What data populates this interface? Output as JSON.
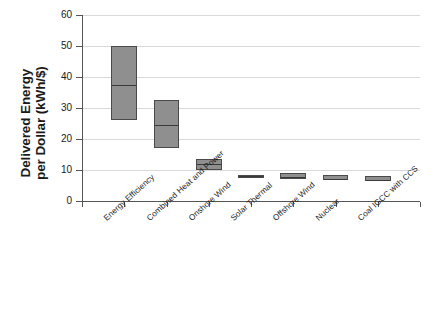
{
  "chart_data": {
    "type": "bar",
    "title": "",
    "xlabel": "",
    "ylabel_line1": "Delivered Energy",
    "ylabel_line2": "per Dollar (kWh/$)",
    "ylim": [
      0,
      60
    ],
    "yticks": [
      0,
      10,
      20,
      30,
      40,
      50,
      60
    ],
    "ytick_labels": [
      "0",
      "10",
      "20",
      "30",
      "40",
      "50",
      "60"
    ],
    "grid": true,
    "legend": "none",
    "box_fill_color": "#8f8f8f",
    "box_edge_color": "#4a4a4a",
    "categories": [
      "Energy Efficiency",
      "Combined Heat and Power",
      "Onshore Wind",
      "Solar Thermal",
      "Offshore Wind",
      "Nuclear",
      "Coal IGCC with CCS"
    ],
    "series": [
      {
        "name": "Delivered Energy per Dollar",
        "boxes": [
          {
            "category": "Energy Efficiency",
            "low": 26.0,
            "median": 37.5,
            "high": 50.0
          },
          {
            "category": "Combined Heat and Power",
            "low": 17.0,
            "median": 24.5,
            "high": 32.5
          },
          {
            "category": "Onshore Wind",
            "low": 10.1,
            "median": 11.9,
            "high": 13.5
          },
          {
            "category": "Solar Thermal",
            "low": 7.9,
            "median": 8.1,
            "high": 8.3
          },
          {
            "category": "Offshore Wind",
            "low": 7.1,
            "median": 7.6,
            "high": 8.9
          },
          {
            "category": "Nuclear",
            "low": 6.8,
            "median": 7.2,
            "high": 8.4
          },
          {
            "category": "Coal IGCC with CCS",
            "low": 6.5,
            "median": 6.9,
            "high": 8.1
          }
        ]
      }
    ]
  }
}
